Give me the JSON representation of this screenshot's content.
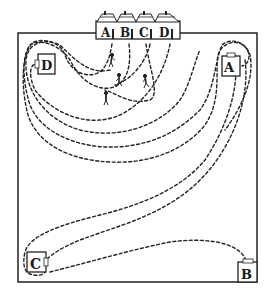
{
  "diagram": {
    "type": "puzzle-map",
    "houses": [
      {
        "label": "A",
        "x": 106
      },
      {
        "label": "B",
        "x": 124
      },
      {
        "label": "C",
        "x": 142
      },
      {
        "label": "D",
        "x": 160
      }
    ],
    "gates": [
      {
        "label": "D",
        "x": 39,
        "y": 65,
        "position": "upper-left"
      },
      {
        "label": "A",
        "x": 231,
        "y": 66,
        "position": "upper-right"
      },
      {
        "label": "C",
        "x": 35,
        "y": 262,
        "position": "lower-left"
      },
      {
        "label": "B",
        "x": 245,
        "y": 272,
        "position": "lower-right"
      }
    ],
    "paths": [
      {
        "from": "house-A",
        "to": "gate-A"
      },
      {
        "from": "house-B",
        "to": "gate-B"
      },
      {
        "from": "house-C",
        "to": "gate-C"
      },
      {
        "from": "house-D",
        "to": "gate-D"
      }
    ],
    "walkers": 4,
    "colors": {
      "ink": "#222222",
      "background": "#ffffff"
    }
  }
}
